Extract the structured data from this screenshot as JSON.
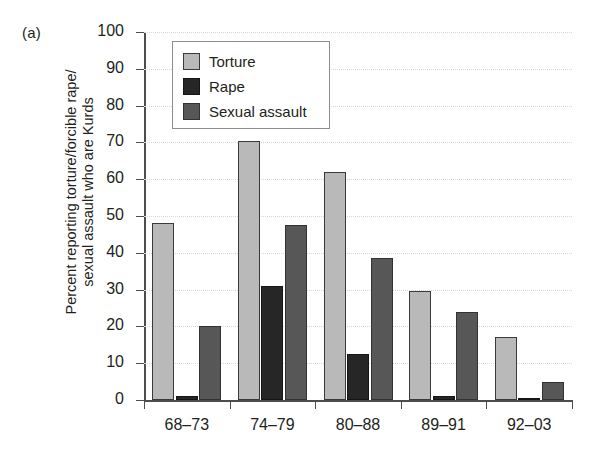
{
  "figure": {
    "panel_label": "(a)",
    "ylabel_line1": "Percent reporting torture/forcible rape/",
    "ylabel_line2": "sexual assault who are Kurds"
  },
  "legend": {
    "position": "inside-top-left",
    "entries": [
      {
        "label": "Torture",
        "color": "#b9b9b9",
        "key": "torture"
      },
      {
        "label": "Rape",
        "color": "#262626",
        "key": "rape"
      },
      {
        "label": "Sexual assault",
        "color": "#575757",
        "key": "sexual-assault"
      }
    ]
  },
  "chart_data": {
    "type": "bar",
    "title": "",
    "subtitle": "",
    "xlabel": "",
    "ylabel": "Percent reporting torture/forcible rape/ sexual assault who are Kurds",
    "categories": [
      "68–73",
      "74–79",
      "80–88",
      "89–91",
      "92–03"
    ],
    "series": [
      {
        "name": "Torture",
        "color": "#b9b9b9",
        "values": [
          48,
          70.5,
          62,
          29.5,
          17
        ]
      },
      {
        "name": "Rape",
        "color": "#262626",
        "values": [
          1,
          31,
          12.5,
          1,
          0.5
        ]
      },
      {
        "name": "Sexual assault",
        "color": "#575757",
        "values": [
          20,
          47.5,
          38.5,
          24,
          5
        ]
      }
    ],
    "ylim": [
      0,
      100
    ],
    "ytick_values": [
      0,
      10,
      20,
      30,
      40,
      50,
      60,
      70,
      80,
      90,
      100
    ],
    "ytick_labels": [
      "0",
      "10",
      "20",
      "30",
      "40",
      "50",
      "60",
      "70",
      "80",
      "90",
      "100"
    ],
    "grid": "horizontal-dotted-faint",
    "legend_position": "upper left (inside axes)"
  }
}
